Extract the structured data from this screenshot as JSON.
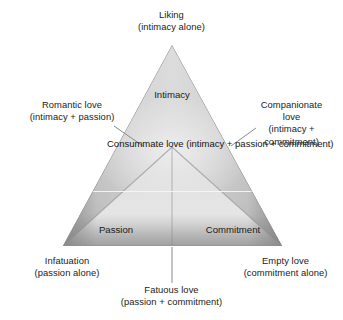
{
  "diagram": {
    "triangle": {
      "vertices": [
        {
          "name": "intimacy",
          "label": "Intimacy"
        },
        {
          "name": "passion",
          "label": "Passion"
        },
        {
          "name": "commitment",
          "label": "Commitment"
        }
      ],
      "center": {
        "name": "consummate-love",
        "line1": "Consummate",
        "line2": "love",
        "line3": "(intimacy +",
        "line4": "passion +",
        "line5": "commitment)"
      }
    },
    "callouts": {
      "top": {
        "name": "liking",
        "line1": "Liking",
        "line2": "(intimacy alone)"
      },
      "left": {
        "name": "romantic-love",
        "line1": "Romantic love",
        "line2": "(intimacy + passion)"
      },
      "right": {
        "name": "companionate-love",
        "line1": "Companionate",
        "line2": "love",
        "line3": "(intimacy +",
        "line4": "commitment)"
      },
      "bottom_left": {
        "name": "infatuation",
        "line1": "Infatuation",
        "line2": "(passion alone)"
      },
      "bottom_right": {
        "name": "empty-love",
        "line1": "Empty love",
        "line2": "(commitment alone)"
      },
      "bottom": {
        "name": "fatuous-love",
        "line1": "Fatuous love",
        "line2": "(passion + commitment)"
      }
    },
    "colors": {
      "background": "#ffffff",
      "text": "#222222",
      "leader_line": "#7a7a7a",
      "fill_light": "#e6e6e6",
      "fill_mid": "#c2c2c2",
      "fill_dark": "#8e8e8e",
      "seam": "#9a9a9a",
      "divider": "#f2f2f2"
    }
  }
}
